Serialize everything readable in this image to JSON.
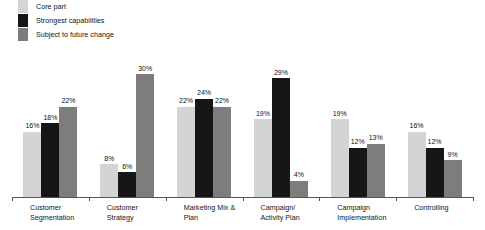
{
  "chart_data": {
    "type": "bar",
    "title": "",
    "subtitle": "",
    "xlabel": "",
    "ylabel": "",
    "ylim": [
      0,
      32
    ],
    "grid": false,
    "value_suffix": "%",
    "legend_position": "top-left",
    "categories": [
      "Customer Segmentation",
      "Customer Strategy",
      "Marketing Mix & Plan",
      "Campaign/ Activity Plan",
      "Campaign Implementation",
      "Controlling"
    ],
    "category_lines": [
      [
        "Customer",
        "Segmentation"
      ],
      [
        "Customer",
        "Strategy"
      ],
      [
        "Marketing Mix &",
        "Plan"
      ],
      [
        "Campaign/",
        "Activity Plan"
      ],
      [
        "Campaign",
        "Implementation"
      ],
      [
        "Controlling"
      ]
    ],
    "series": [
      {
        "name": "Core part",
        "color": "#d4d4d4",
        "values": [
          16,
          8,
          22,
          19,
          19,
          16
        ],
        "labels": [
          "16%",
          "8%",
          "22%",
          "19%",
          "19%",
          "16%"
        ]
      },
      {
        "name": "Strongest capabilities",
        "color": "#161616",
        "values": [
          18,
          6,
          24,
          29,
          12,
          12
        ],
        "labels": [
          "18%",
          "6%",
          "24%",
          "29%",
          "12%",
          "12%"
        ]
      },
      {
        "name": "Subject to future change",
        "color": "#7d7d7d",
        "values": [
          22,
          30,
          22,
          4,
          13,
          9
        ],
        "labels": [
          "22%",
          "30%",
          "22%",
          "4%",
          "13%",
          "9%"
        ]
      }
    ]
  },
  "legend": {
    "items": [
      {
        "label": "Core part",
        "color": "#d4d4d4"
      },
      {
        "label": "Strongest capabilities",
        "color": "#161616"
      },
      {
        "label": "Subject to future change",
        "color": "#7d7d7d"
      }
    ]
  },
  "axis": {
    "line_color": "#555555"
  }
}
